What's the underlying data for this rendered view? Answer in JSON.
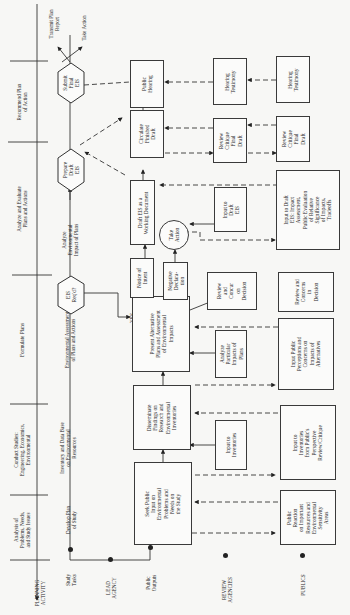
{
  "phases": [
    {
      "label": "Analysis of\nProblems, Needs,\nand Study Issues"
    },
    {
      "label": "Conduct Studies:\nEngineering, Economics,\nEnvironmental"
    },
    {
      "label": "Formulate Plans"
    },
    {
      "label": "Analyze and Evaluate\nPlans and Actions"
    },
    {
      "label": "Recommend Plan\nof Action"
    }
  ],
  "rows": {
    "planning_activity": "PLANNING\nACTIVITY",
    "study_tasks": "Study\nTasks",
    "lead_agency": "LEAD\nAGENCY",
    "public_outputs": "Public\nOutputs",
    "review_agencies": "REVIEW\nAGENCIES",
    "publics": "PUBLICS"
  },
  "study_tasks": [
    "Develop Plan\nof Study",
    "Inventory and Data Base\non Environmental\nResources",
    "Environmental Assessment\nof Plans and Actions",
    "Analyze\nEnvironmental\nImpact of Plans"
  ],
  "decisions": {
    "eis_reqd": "EIS\nReq'd?",
    "prepare_draft_eis": "Prepare\nDraft\nEIS",
    "submit_final_eis": "Submit\nFinal\nEIS",
    "yes": "YES",
    "no": "NO"
  },
  "outputs": {
    "transmit_plan_report": "Transmit Plan\nReport",
    "take_action": "Take Action"
  },
  "lead_agency_boxes": {
    "seek_public_input": "Seek Public\nInput on\nEnvironmental\nProblems and\nNeeds on\nthe Study",
    "disseminate_findings": "Disseminate\nFindings on\nResearch and\nEnvironmental\nInventories",
    "present_alternative_plans": "Present Alternative\nPlans and Assessment\nof Environmental\nImpacts",
    "notice_of_intent": "Notice of\nIntent",
    "negative_declaration": "Negative\nDeclara-\ntion",
    "take_action_circle": "Take\nAction",
    "draft_eis_working": "Draft EIS as a\nWorking Document",
    "circulate_finished_draft": "Circulate\nFinished\nDraft",
    "public_hearing": "Public\nHearing"
  },
  "review_agency_boxes": {
    "input_to_inventories": "Input to\nInventories",
    "analyze_particular_impacts": "Analyze\nParticular\nImpacts of\nPlans",
    "review_concur_decision": "Review\nand\nConcur\non\nDecision",
    "input_to_draft_eis": "Input to\nDraft\nEIS",
    "review_critique_final_draft": "Review\nCritique\nFinal\nDraft",
    "hearing_testimony": "Hearing\nTestimony"
  },
  "public_boxes": {
    "public_reaction": "Public\nReaction\non Important\nResources and\nEnvironmental\nSensitivity\nAreas",
    "input_from_publics_perspective": "Input to\nInventories\nfrom Public's\nPerspective\nReview/Critique",
    "input_public_perceptions": "Input Public\nPerceptions and\nConcerns on\nImpacts of\nAlternatives",
    "review_concerns_decision": "Review and\nConcerns\nin\nDecision",
    "input_draft_eis_impact": "Input to Draft\nEIS: Impact\nAssessment,\nPublic Evaluation\nof Relative\nSignificance\nof Impacts,\nTradeoffs",
    "review_critique_final_draft": "Review\nCritique\nFinal\nDraft",
    "hearing_testimony": "Hearing\nTestimony"
  }
}
